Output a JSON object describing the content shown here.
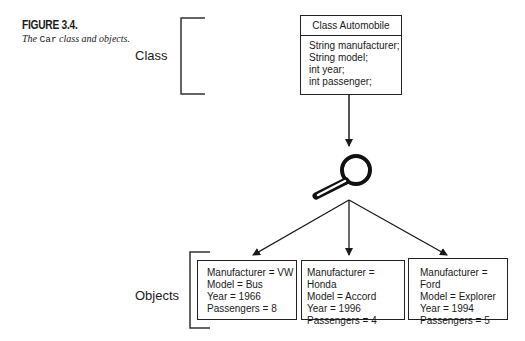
{
  "figure": {
    "number": "FIGURE 3.4.",
    "caption_prefix": "The",
    "caption_code": "Car",
    "caption_suffix": "class and objects."
  },
  "labels": {
    "class": "Class",
    "objects": "Objects"
  },
  "class_box": {
    "title": "Class Automobile",
    "fields": [
      "String manufacturer;",
      "String model;",
      "int year;",
      "int passenger;"
    ]
  },
  "icon": "magnifying-glass-icon",
  "objects": [
    {
      "manufacturer": "Manufacturer = VW",
      "model": "Model = Bus",
      "year": "Year = 1966",
      "passengers": "Passengers = 8"
    },
    {
      "manufacturer": "Manufacturer = Honda",
      "model": "Model = Accord",
      "year": "Year = 1996",
      "passengers": "Passengers = 4"
    },
    {
      "manufacturer": "Manufacturer = Ford",
      "model": "Model = Explorer",
      "year": "Year = 1994",
      "passengers": "Passengers = 5"
    }
  ]
}
